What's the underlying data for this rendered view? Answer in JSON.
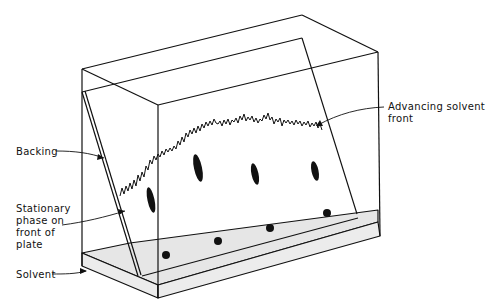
{
  "diagram": {
    "labels": {
      "backing": "Backing",
      "stationary": [
        "Stationary",
        "phase on",
        "front of",
        "plate"
      ],
      "solvent": "Solvent",
      "solvent_front": [
        "Advancing solvent",
        "front"
      ]
    },
    "colors": {
      "line": "#111111",
      "solvent_fill": "#e6e6e6",
      "background": "#ffffff"
    },
    "spots": {
      "origin_count": 4,
      "developed_count": 4
    }
  }
}
